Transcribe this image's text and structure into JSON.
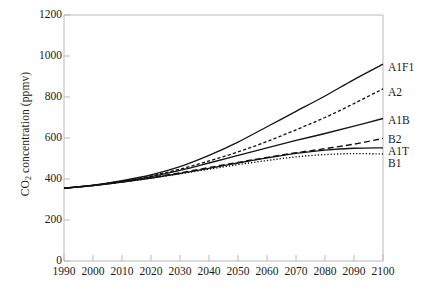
{
  "chart_data": {
    "type": "line",
    "title": "",
    "xlabel": "",
    "ylabel": "CO2 concentration (ppmv)",
    "ylabel_prefix": "CO",
    "ylabel_sub": "2",
    "ylabel_suffix": " concentration (ppmv)",
    "xlim": [
      1990,
      2100
    ],
    "ylim": [
      0,
      1200
    ],
    "grid": false,
    "legend_position": "right-of-axes-inline",
    "x_ticks": [
      1990,
      2000,
      2010,
      2020,
      2030,
      2040,
      2050,
      2060,
      2070,
      2080,
      2090,
      2100
    ],
    "y_ticks": [
      0,
      200,
      400,
      600,
      800,
      1000,
      1200
    ],
    "x": [
      1990,
      2000,
      2010,
      2020,
      2030,
      2040,
      2050,
      2060,
      2070,
      2080,
      2090,
      2100
    ],
    "series": [
      {
        "name": "A1F1",
        "style": "solid",
        "label": "A1F1",
        "values": [
          355,
          370,
          392,
          420,
          460,
          515,
          580,
          655,
          730,
          805,
          885,
          960
        ]
      },
      {
        "name": "A2",
        "style": "dotted-dash",
        "label": "A2",
        "values": [
          355,
          369,
          389,
          415,
          448,
          488,
          532,
          583,
          640,
          700,
          768,
          840
        ]
      },
      {
        "name": "A1B",
        "style": "solid",
        "label": "A1B",
        "values": [
          355,
          369,
          388,
          412,
          442,
          478,
          515,
          552,
          588,
          622,
          658,
          695
        ]
      },
      {
        "name": "B2",
        "style": "dashed",
        "label": "B2",
        "values": [
          355,
          368,
          386,
          407,
          430,
          456,
          481,
          505,
          528,
          548,
          570,
          598
        ]
      },
      {
        "name": "A1T",
        "style": "solid",
        "label": "A1T",
        "values": [
          355,
          368,
          385,
          405,
          427,
          452,
          478,
          503,
          525,
          541,
          550,
          552
        ]
      },
      {
        "name": "B1",
        "style": "fine-dotted",
        "label": "B1",
        "values": [
          355,
          368,
          385,
          404,
          425,
          448,
          470,
          490,
          508,
          519,
          524,
          522
        ]
      }
    ]
  },
  "labels": {
    "A1F1": "A1F1",
    "A2": "A2",
    "A1B": "A1B",
    "B2": "B2",
    "A1T": "A1T",
    "B1": "B1"
  },
  "yticks": {
    "t0": "0",
    "t200": "200",
    "t400": "400",
    "t600": "600",
    "t800": "800",
    "t1000": "1000",
    "t1200": "1200"
  },
  "xticks": {
    "t1990": "1990",
    "t2000": "2000",
    "t2010": "2010",
    "t2020": "2020",
    "t2030": "2030",
    "t2040": "2040",
    "t2050": "2050",
    "t2060": "2060",
    "t2070": "2070",
    "t2080": "2080",
    "t2090": "2090",
    "t2100": "2100"
  },
  "colors": {
    "curve": "#141414",
    "frame": "#b9b9b9",
    "text": "#1a1a1a",
    "background": "#ffffff"
  }
}
